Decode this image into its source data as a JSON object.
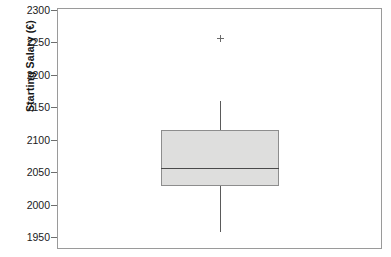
{
  "chart_data": {
    "type": "boxplot",
    "title": "",
    "xlabel": "",
    "ylabel": "Starting Salary (€)",
    "ylim": [
      1940,
      2300
    ],
    "yticks": [
      1950,
      2000,
      2050,
      2100,
      2150,
      2200,
      2250,
      2300
    ],
    "ytick_labels": [
      "1950",
      "2000",
      "2050",
      "2100",
      "2150",
      "2200",
      "2250",
      "2300"
    ],
    "grid": false,
    "legend": null,
    "categories": [
      "Starting Salary"
    ],
    "boxes": [
      {
        "label": "Starting Salary",
        "whisker_low": 1957,
        "q1": 2029,
        "median": 2057,
        "q3": 2115,
        "whisker_high": 2160,
        "outliers": [
          2257
        ]
      }
    ],
    "colors": {
      "box_fill": "#dededd",
      "box_edge": "#8d8d8d",
      "median": "#4a4a4a",
      "whisker": "#5a5a5a",
      "outlier": "#6a6a6a",
      "frame": "#9a9a9a",
      "text": "#1a1a1a"
    },
    "annotations": []
  },
  "axis": {
    "ylabel": "Starting Salary (€)",
    "tick_2300": "2300",
    "tick_2250": "2250",
    "tick_2200": "2200",
    "tick_2150": "2150",
    "tick_2100": "2100",
    "tick_2050": "2050",
    "tick_2000": "2000",
    "tick_1950": "1950"
  }
}
